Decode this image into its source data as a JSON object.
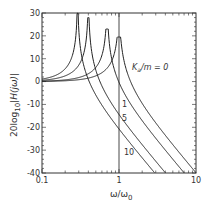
{
  "chart_data": {
    "type": "line",
    "title": "",
    "xlabel": "ω/ω0",
    "xlabel_main": "ω/ω",
    "xlabel_sub": "0",
    "ylabel": "20log10|H(jω)|",
    "ylabel_main": "20log",
    "ylabel_sub": "10",
    "ylabel_rest": "|H(jω)|",
    "xscale": "log",
    "xlim": [
      0.1,
      10
    ],
    "ylim": [
      -40,
      30
    ],
    "x_ticks": [
      "0.1",
      "1",
      "10"
    ],
    "y_ticks": [
      "30",
      "20",
      "10",
      "0",
      "-10",
      "-20",
      "-30",
      "-40"
    ],
    "reference_line_x": 1,
    "grid": false,
    "series": [
      {
        "name": "Ka/m = 0",
        "label": "Ka/m = 0",
        "resonance": 1.0,
        "peak_db": 19.5
      },
      {
        "name": "1",
        "label": "1",
        "resonance": 0.7,
        "peak_db": 23
      },
      {
        "name": "5",
        "label": "5",
        "resonance": 0.4,
        "peak_db": 28
      },
      {
        "name": "10",
        "label": "10",
        "resonance": 0.29,
        "peak_db": 30
      }
    ],
    "sample_points": {
      "x": [
        0.1,
        0.2,
        0.29,
        0.4,
        0.7,
        1,
        2,
        5,
        10
      ],
      "Ka/m = 0": [
        0.1,
        0.4,
        0.8,
        1.5,
        5.8,
        19.5,
        -9.5,
        -27.6,
        -40
      ],
      "1": [
        0.2,
        0.8,
        1.9,
        3.9,
        23,
        -6.3,
        -18.1,
        -34,
        -46
      ],
      "5": [
        0.6,
        2.6,
        7.6,
        28,
        -7.8,
        -15.1,
        -27.6,
        -44,
        -56
      ],
      "10": [
        1.1,
        6.3,
        30,
        -5.5,
        -15.1,
        -21.1,
        -33.4,
        -49.5,
        -61.5
      ]
    }
  },
  "labels": {
    "ka_main": "K",
    "ka_sub": "a",
    "ka_rest": "/m = 0",
    "k1": "1",
    "k5": "5",
    "k10": "10"
  }
}
